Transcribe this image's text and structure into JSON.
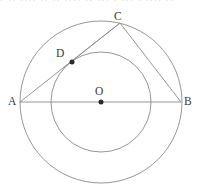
{
  "figure": {
    "kind": "geometry-diagram",
    "stroke_color": "#8a8a8a",
    "label_color": "#3b3b3b",
    "background_color": "#ffffff",
    "labels": {
      "A": "A",
      "B": "B",
      "C": "C",
      "D": "D",
      "O": "O"
    },
    "points": [
      {
        "name": "A",
        "label": "A",
        "x": 20,
        "y": 102,
        "dot": false
      },
      {
        "name": "B",
        "label": "B",
        "x": 181,
        "y": 102,
        "dot": false
      },
      {
        "name": "C",
        "label": "C",
        "x": 120,
        "y": 23,
        "dot": false
      },
      {
        "name": "D",
        "label": "D",
        "x": 72,
        "y": 62,
        "dot": true
      },
      {
        "name": "O",
        "label": "O",
        "x": 101,
        "y": 102,
        "dot": true
      }
    ],
    "circles": [
      {
        "name": "outer-circle",
        "cx": 101,
        "cy": 102,
        "r": 81
      },
      {
        "name": "inner-circle",
        "cx": 101,
        "cy": 102,
        "r": 50
      }
    ],
    "segments": [
      {
        "name": "segment-AB",
        "from": "A",
        "to": "B",
        "x1": 20,
        "y1": 102,
        "x2": 181,
        "y2": 102
      },
      {
        "name": "segment-AC",
        "from": "A",
        "to": "C",
        "x1": 20,
        "y1": 102,
        "x2": 120,
        "y2": 23
      },
      {
        "name": "segment-CB",
        "from": "C",
        "to": "B",
        "x1": 120,
        "y1": 23,
        "x2": 181,
        "y2": 102
      },
      {
        "name": "segment-CD-extension",
        "from": "C",
        "to": "D",
        "x1": 120,
        "y1": 23,
        "x2": 63,
        "y2": 68
      }
    ]
  },
  "scan_artifact": {
    "cropped_text_line": "· ··  ···· ·· ·· ···· ·· ··· · ··· ·  ···· ··"
  }
}
